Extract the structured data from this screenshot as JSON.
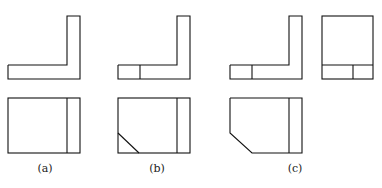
{
  "figure": {
    "stroke_color": "#111111",
    "background": "#ffffff",
    "panels": [
      {
        "label": "(a)",
        "label_x": 45,
        "label_y": 163,
        "views": [
          "front",
          "top"
        ]
      },
      {
        "label": "(b)",
        "label_x": 157,
        "label_y": 163,
        "views": [
          "front",
          "top"
        ]
      },
      {
        "label": "(c)",
        "label_x": 295,
        "label_y": 163,
        "views": [
          "front",
          "side",
          "top"
        ]
      }
    ]
  }
}
